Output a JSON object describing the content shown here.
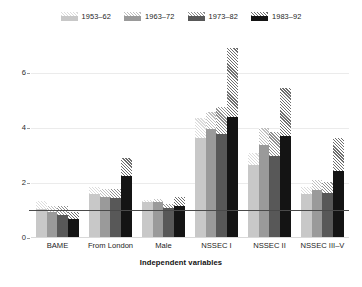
{
  "chart_data": {
    "type": "bar",
    "title": "",
    "subtitle": "",
    "xlabel": "Independent variables",
    "ylabel": "",
    "categories": [
      "BAME",
      "From London",
      "Male",
      "NSSEC I",
      "NSSEC II",
      "NSSEC III–V"
    ],
    "ylim": [
      0,
      7.2
    ],
    "yticks": [
      0,
      2,
      4,
      6
    ],
    "ytick_labels": [
      "0",
      "2",
      "4",
      "6"
    ],
    "grid": "horizontal",
    "legend_position": "top-center",
    "reference_line": {
      "value": 1,
      "orientation": "horizontal",
      "color": "#4a4a4a"
    },
    "note": "Solid bar segment is the point estimate; the lighter hatched segment above it extends to the upper confidence bound.",
    "series": [
      {
        "name": "1953–62",
        "color": "#c8c8c8",
        "hatch_color": "#dcdcdc",
        "values": [
          1.05,
          1.6,
          1.3,
          3.65,
          2.65,
          1.6
        ],
        "ci_upper": [
          1.35,
          1.85,
          1.4,
          4.35,
          3.1,
          1.85
        ]
      },
      {
        "name": "1963–72",
        "color": "#9a9a9a",
        "hatch_color": "#c0c0c0",
        "values": [
          0.95,
          1.5,
          1.32,
          3.95,
          3.4,
          1.75
        ],
        "ci_upper": [
          1.15,
          1.8,
          1.42,
          4.6,
          4.0,
          2.1
        ]
      },
      {
        "name": "1973–82",
        "color": "#585858",
        "hatch_color": "#8f8f8f",
        "values": [
          0.85,
          1.45,
          1.1,
          3.8,
          3.0,
          1.65
        ],
        "ci_upper": [
          1.15,
          1.8,
          1.25,
          4.75,
          3.85,
          2.05
        ]
      },
      {
        "name": "1983–92",
        "color": "#141414",
        "hatch_color": "#6e6e6e",
        "values": [
          0.7,
          2.25,
          1.18,
          4.4,
          3.7,
          2.45
        ],
        "ci_upper": [
          0.95,
          2.9,
          1.5,
          6.9,
          5.45,
          3.65
        ]
      }
    ]
  },
  "legend": {
    "entries": [
      {
        "label": "1953–62"
      },
      {
        "label": "1963–72"
      },
      {
        "label": "1973–82"
      },
      {
        "label": "1983–92"
      }
    ]
  },
  "axes": {
    "x_title": "Independent variables",
    "y_tick_labels": [
      "0",
      "2",
      "4",
      "6"
    ],
    "x_tick_labels": [
      "BAME",
      "From London",
      "Male",
      "NSSEC I",
      "NSSEC II",
      "NSSEC III–V"
    ]
  }
}
